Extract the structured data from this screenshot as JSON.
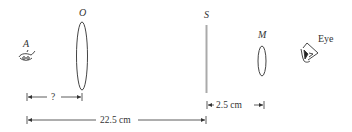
{
  "labels": {
    "source": "A",
    "objective": "O",
    "screen": "S",
    "eyepiece": "M",
    "eye": "Eye"
  },
  "dimensions": {
    "unknown": "?",
    "total": "22.5 cm",
    "screen_to_eyepiece": "2.5 cm"
  },
  "colors": {
    "line": "#333333",
    "screen": "#aaaaaa",
    "background": "#ffffff"
  }
}
